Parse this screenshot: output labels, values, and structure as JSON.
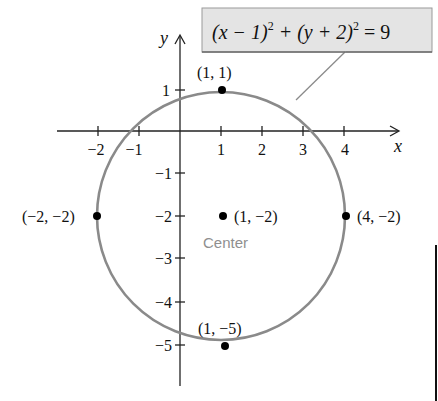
{
  "equation": {
    "left": "(x − 1)",
    "exp1": "2",
    "mid": " + (y + 2)",
    "exp2": "2",
    "right": " = 9"
  },
  "axes": {
    "x_label": "x",
    "y_label": "y",
    "x_ticks": [
      "−2",
      "−1",
      "1",
      "2",
      "3",
      "4"
    ],
    "y_ticks": [
      "1",
      "−1",
      "−2",
      "−3",
      "−4",
      "−5"
    ]
  },
  "points": {
    "top": "(1, 1)",
    "left": "(−2, −2)",
    "center": "(1, −2)",
    "right": "(4, −2)",
    "bottom": "(1, −5)"
  },
  "center_caption": "Center",
  "colors": {
    "circle": "#8a8a8a",
    "callout_bg": "#e4e4e4",
    "caption": "#8f8f8f"
  }
}
